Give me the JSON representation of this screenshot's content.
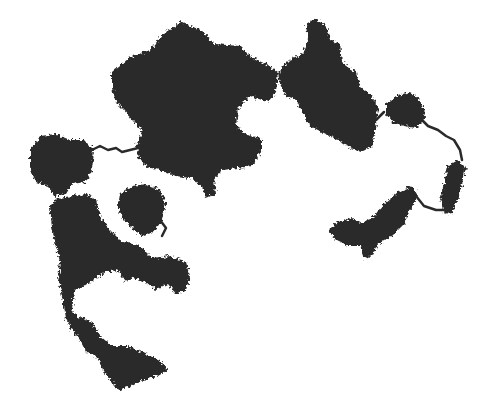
{
  "image": {
    "description": "Random-walk / diffusion-limited aggregation style fractal cluster, dark blobs connected by thin branches on white background",
    "colors": {
      "cluster": "#2a2a2a",
      "background": "#ffffff",
      "cutoff_text": "#d8d8d8"
    },
    "cutoff_text": "· ·· ··· ····· ·"
  }
}
